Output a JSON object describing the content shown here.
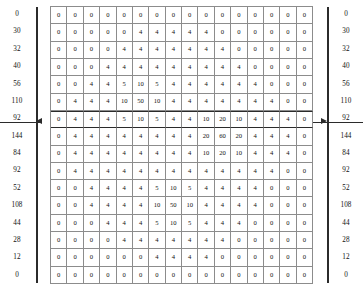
{
  "diagram": {
    "type": "numeric-matrix-grid",
    "rows": 16,
    "cols": 16,
    "highlighted_row_index": 6,
    "row_labels_left": [
      "0",
      "30",
      "32",
      "40",
      "56",
      "110",
      "92",
      "144",
      "84",
      "92",
      "52",
      "108",
      "44",
      "28",
      "12",
      "0"
    ],
    "row_labels_right": [
      "0",
      "30",
      "32",
      "40",
      "56",
      "110",
      "92",
      "144",
      "84",
      "92",
      "52",
      "108",
      "44",
      "28",
      "12",
      "0"
    ],
    "grid": [
      [
        "0",
        "0",
        "0",
        "0",
        "0",
        "0",
        "0",
        "0",
        "0",
        "0",
        "0",
        "0",
        "0",
        "0",
        "0",
        "0"
      ],
      [
        "0",
        "0",
        "0",
        "0",
        "0",
        "4",
        "4",
        "4",
        "4",
        "4",
        "0",
        "0",
        "0",
        "0",
        "0",
        "0"
      ],
      [
        "0",
        "0",
        "0",
        "0",
        "4",
        "4",
        "4",
        "4",
        "4",
        "4",
        "4",
        "0",
        "0",
        "0",
        "0",
        "0"
      ],
      [
        "0",
        "0",
        "0",
        "4",
        "4",
        "4",
        "4",
        "4",
        "4",
        "4",
        "4",
        "4",
        "0",
        "0",
        "0",
        "0"
      ],
      [
        "0",
        "0",
        "4",
        "4",
        "5",
        "10",
        "5",
        "4",
        "4",
        "4",
        "4",
        "4",
        "4",
        "0",
        "0",
        "0"
      ],
      [
        "0",
        "4",
        "4",
        "4",
        "10",
        "50",
        "10",
        "4",
        "4",
        "4",
        "4",
        "4",
        "4",
        "4",
        "0",
        "0"
      ],
      [
        "0",
        "4",
        "4",
        "4",
        "5",
        "10",
        "5",
        "4",
        "4",
        "10",
        "20",
        "10",
        "4",
        "4",
        "4",
        "0"
      ],
      [
        "0",
        "4",
        "4",
        "4",
        "4",
        "4",
        "4",
        "4",
        "4",
        "20",
        "60",
        "20",
        "4",
        "4",
        "4",
        "0"
      ],
      [
        "0",
        "4",
        "4",
        "4",
        "4",
        "4",
        "4",
        "4",
        "4",
        "10",
        "20",
        "10",
        "4",
        "4",
        "4",
        "0"
      ],
      [
        "0",
        "4",
        "4",
        "4",
        "4",
        "4",
        "4",
        "4",
        "4",
        "4",
        "4",
        "4",
        "4",
        "4",
        "0",
        "0"
      ],
      [
        "0",
        "0",
        "4",
        "4",
        "4",
        "4",
        "5",
        "10",
        "5",
        "4",
        "4",
        "4",
        "4",
        "0",
        "0",
        "0"
      ],
      [
        "0",
        "0",
        "4",
        "4",
        "4",
        "4",
        "10",
        "50",
        "10",
        "4",
        "4",
        "4",
        "4",
        "0",
        "0",
        "0"
      ],
      [
        "0",
        "0",
        "0",
        "4",
        "4",
        "4",
        "5",
        "10",
        "5",
        "4",
        "4",
        "4",
        "0",
        "0",
        "0",
        "0"
      ],
      [
        "0",
        "0",
        "0",
        "0",
        "4",
        "4",
        "4",
        "4",
        "4",
        "4",
        "4",
        "0",
        "0",
        "0",
        "0",
        "0"
      ],
      [
        "0",
        "0",
        "0",
        "0",
        "0",
        "0",
        "4",
        "4",
        "4",
        "4",
        "0",
        "0",
        "0",
        "0",
        "0",
        "0"
      ],
      [
        "0",
        "0",
        "0",
        "0",
        "0",
        "0",
        "0",
        "0",
        "0",
        "0",
        "0",
        "0",
        "0",
        "0",
        "0",
        "0"
      ]
    ],
    "colors": {
      "grid_line": "#8c8c8c",
      "axis_rule": "#2b2b2b",
      "pointer": "#2b2b2b",
      "text": "#111111",
      "background": "#ffffff"
    }
  }
}
